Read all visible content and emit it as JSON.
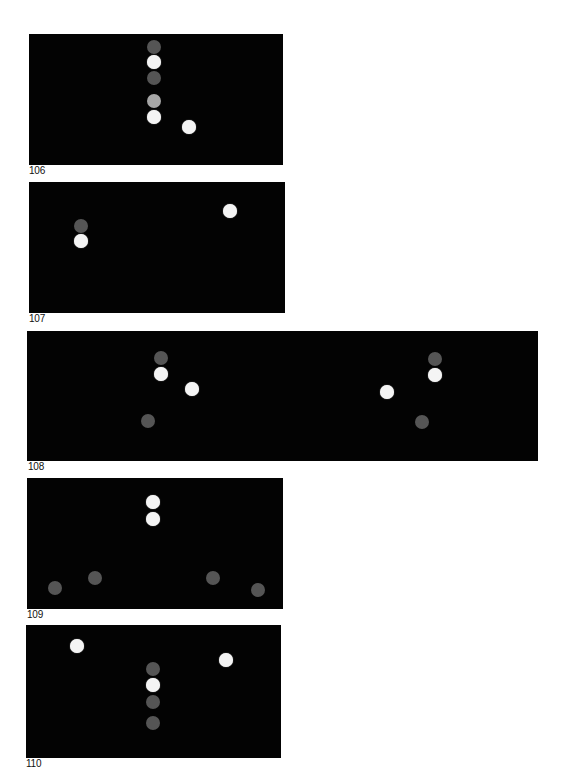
{
  "colors": {
    "panel_background": "#030303",
    "page_background": "#ffffff",
    "white_dot": "#f4f4f4",
    "gray_dot": "#555555",
    "light_gray_dot": "#a6a6a6"
  },
  "figures": [
    {
      "label": "106",
      "panel": {
        "x": 29,
        "y": 34,
        "w": 254,
        "h": 131
      },
      "label_pos": {
        "x": 29,
        "y": 166
      },
      "dots": [
        {
          "x": 154,
          "y": 47,
          "tone": "gray"
        },
        {
          "x": 154,
          "y": 62,
          "tone": "white"
        },
        {
          "x": 154,
          "y": 78,
          "tone": "gray"
        },
        {
          "x": 154,
          "y": 101,
          "tone": "lightgray"
        },
        {
          "x": 154,
          "y": 117,
          "tone": "white"
        },
        {
          "x": 189,
          "y": 127,
          "tone": "white"
        }
      ]
    },
    {
      "label": "107",
      "panel": {
        "x": 29,
        "y": 182,
        "w": 256,
        "h": 131
      },
      "label_pos": {
        "x": 29,
        "y": 314
      },
      "dots": [
        {
          "x": 81,
          "y": 226,
          "tone": "gray"
        },
        {
          "x": 81,
          "y": 241,
          "tone": "white"
        },
        {
          "x": 230,
          "y": 211,
          "tone": "white"
        }
      ]
    },
    {
      "label": "108",
      "panel": {
        "x": 27,
        "y": 331,
        "w": 511,
        "h": 130
      },
      "label_pos": {
        "x": 28,
        "y": 462
      },
      "dots": [
        {
          "x": 161,
          "y": 358,
          "tone": "gray"
        },
        {
          "x": 161,
          "y": 374,
          "tone": "white"
        },
        {
          "x": 192,
          "y": 389,
          "tone": "white"
        },
        {
          "x": 148,
          "y": 421,
          "tone": "gray"
        },
        {
          "x": 435,
          "y": 359,
          "tone": "gray"
        },
        {
          "x": 435,
          "y": 375,
          "tone": "white"
        },
        {
          "x": 387,
          "y": 392,
          "tone": "white"
        },
        {
          "x": 422,
          "y": 422,
          "tone": "gray"
        }
      ]
    },
    {
      "label": "109",
      "panel": {
        "x": 27,
        "y": 478,
        "w": 256,
        "h": 131
      },
      "label_pos": {
        "x": 27,
        "y": 610
      },
      "dots": [
        {
          "x": 153,
          "y": 502,
          "tone": "white"
        },
        {
          "x": 153,
          "y": 519,
          "tone": "white"
        },
        {
          "x": 95,
          "y": 578,
          "tone": "gray"
        },
        {
          "x": 55,
          "y": 588,
          "tone": "gray"
        },
        {
          "x": 213,
          "y": 578,
          "tone": "gray"
        },
        {
          "x": 258,
          "y": 590,
          "tone": "gray"
        }
      ]
    },
    {
      "label": "110",
      "panel": {
        "x": 26,
        "y": 625,
        "w": 255,
        "h": 133
      },
      "label_pos": {
        "x": 26,
        "y": 759
      },
      "dots": [
        {
          "x": 77,
          "y": 646,
          "tone": "white"
        },
        {
          "x": 226,
          "y": 660,
          "tone": "white"
        },
        {
          "x": 153,
          "y": 669,
          "tone": "gray"
        },
        {
          "x": 153,
          "y": 685,
          "tone": "white"
        },
        {
          "x": 153,
          "y": 702,
          "tone": "gray"
        },
        {
          "x": 153,
          "y": 723,
          "tone": "gray"
        }
      ]
    }
  ]
}
